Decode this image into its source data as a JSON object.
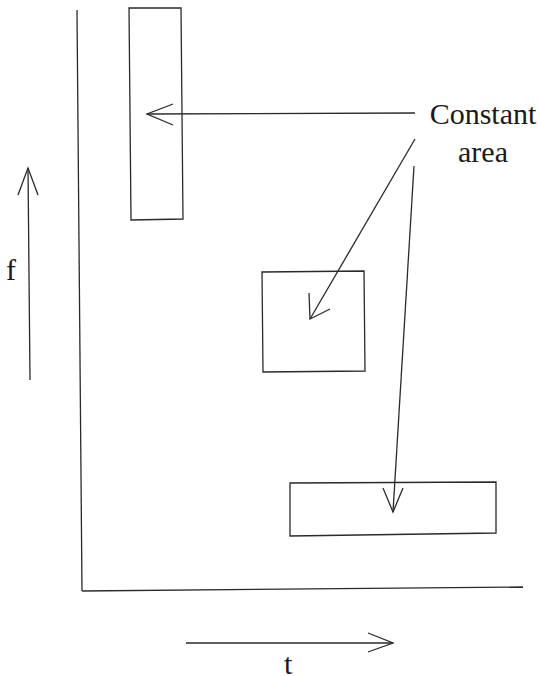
{
  "diagram": {
    "axes": {
      "frequency_label": "f",
      "time_label": "t"
    },
    "annotation": {
      "line1": "Constant",
      "line2": "area"
    },
    "tiles": [
      {
        "name": "tall-narrow-tile",
        "x": 129,
        "y": 8,
        "width": 53,
        "height": 212
      },
      {
        "name": "square-tile",
        "x": 262,
        "y": 271,
        "width": 103,
        "height": 101
      },
      {
        "name": "wide-short-tile",
        "x": 290,
        "y": 482,
        "width": 206,
        "height": 54
      }
    ],
    "colors": {
      "stroke": "#2a2a2a",
      "background": "#ffffff"
    }
  }
}
